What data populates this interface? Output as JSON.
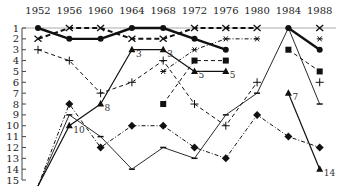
{
  "chart_data": {
    "type": "line",
    "title": "",
    "xlabel": "",
    "ylabel": "",
    "x": [
      1952,
      1956,
      1960,
      1964,
      1968,
      1972,
      1976,
      1980,
      1984,
      1988
    ],
    "x_tick_labels": [
      "1952",
      "1956",
      "1960",
      "1964",
      "1968",
      "1972",
      "1976",
      "1980",
      "1984",
      "1988"
    ],
    "y_tick_labels": [
      "1",
      "2",
      "3",
      "4",
      "5",
      "6",
      "7",
      "8",
      "9",
      "10",
      "11",
      "12",
      "13",
      "14",
      "15"
    ],
    "ylim": [
      15,
      1
    ],
    "y_inverted": true,
    "grid": false,
    "legend": null,
    "series": [
      {
        "name": "circle-thick-solid",
        "marker": "circle",
        "style": "solid-thick",
        "values": [
          1,
          2,
          2,
          1,
          1,
          2,
          3,
          null,
          1,
          3
        ]
      },
      {
        "name": "x-thick-dashed",
        "marker": "x",
        "style": "dashed-thick",
        "values": [
          2,
          1,
          1,
          2,
          2,
          1,
          1,
          1,
          null,
          1
        ]
      },
      {
        "name": "asterisk-dashdot",
        "marker": "asterisk",
        "style": "dashdot",
        "values": [
          null,
          null,
          null,
          null,
          5,
          3,
          2,
          2,
          null,
          2
        ]
      },
      {
        "name": "plus-dashed",
        "marker": "plus",
        "style": "dashed",
        "values": [
          3,
          4,
          7,
          6,
          4,
          8,
          10,
          6,
          null,
          6
        ]
      },
      {
        "name": "square-dashed",
        "marker": "square",
        "style": "dashed",
        "values": [
          null,
          null,
          null,
          null,
          8,
          4,
          4,
          null,
          3,
          5
        ]
      },
      {
        "name": "triangle-solid-a",
        "marker": "triangle",
        "style": "solid",
        "values": [
          16,
          10,
          8,
          3,
          3,
          5,
          5,
          null,
          null,
          null
        ],
        "point_labels": {
          "1956": "10",
          "1960": "8",
          "1964": "3",
          "1968": "3",
          "1972": "5",
          "1976": "5"
        }
      },
      {
        "name": "triangle-solid-b",
        "marker": "triangle",
        "style": "solid",
        "values": [
          null,
          null,
          null,
          null,
          null,
          null,
          null,
          null,
          7,
          14
        ],
        "point_labels": {
          "1984": "7",
          "1988": "14"
        }
      },
      {
        "name": "dash-solid-thin",
        "marker": "dash",
        "style": "solid-thin",
        "values": [
          16,
          9,
          11,
          14,
          12,
          13,
          9,
          7,
          1,
          8
        ]
      },
      {
        "name": "diamond-dashdot",
        "marker": "diamond",
        "style": "dashdot",
        "values": [
          16,
          8,
          12,
          10,
          10,
          12,
          13,
          9,
          11,
          12
        ]
      }
    ]
  }
}
